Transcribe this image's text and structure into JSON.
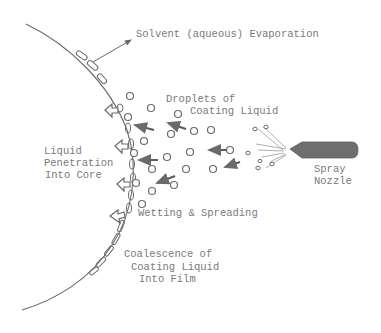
{
  "diagram": {
    "colors": {
      "line": "#6a6a6a",
      "text": "#7a7a7a",
      "nozzle": "#6e6e6e",
      "background": "#ffffff"
    },
    "labels": {
      "evaporation": "Solvent (aqueous) Evaporation",
      "droplets_line1": "Droplets of",
      "droplets_line2": "Coating Liquid",
      "penetration_line1": "Liquid",
      "penetration_line2": "Penetration",
      "penetration_line3": "Into Core",
      "nozzle_line1": "Spray",
      "nozzle_line2": "Nozzle",
      "wetting": "Wetting & Spreading",
      "coalescence_line1": "Coalescence of",
      "coalescence_line2": "Coating Liquid",
      "coalescence_line3": "Into Film"
    },
    "icons": {
      "surface": "curved-tablet-surface",
      "film_segment": "rounded-rect-film",
      "droplet": "circle-droplet",
      "travel_arrow": "solid-arrow-left",
      "penetration_arrow": "hollow-arrow-left",
      "nozzle": "spray-nozzle-shape"
    }
  }
}
